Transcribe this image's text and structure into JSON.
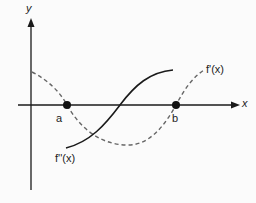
{
  "axes": {
    "x_label": "x",
    "y_label": "y"
  },
  "points": [
    {
      "label": "a"
    },
    {
      "label": "b"
    }
  ],
  "curves": [
    {
      "name": "f'(x)",
      "style": "dashed"
    },
    {
      "name": "f''(x)",
      "style": "solid"
    }
  ],
  "colors": {
    "ink": "#1a1a1a",
    "dashed": "#666666"
  }
}
